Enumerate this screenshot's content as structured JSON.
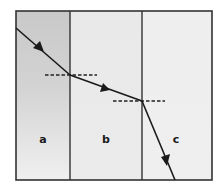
{
  "diagram": {
    "type": "refraction through three media",
    "regions": [
      {
        "label": "a",
        "fill_top": "#cfcfcf",
        "fill_bottom": "#ececec"
      },
      {
        "label": "b",
        "fill_top": "#e6e6e6",
        "fill_bottom": "#ececec"
      },
      {
        "label": "c",
        "fill_top": "#eeeeee",
        "fill_bottom": "#efefef"
      }
    ],
    "ray": {
      "description": "Ray travels through region a, refracts at boundary a|b bending away from normal, then refracts at boundary b|c bending toward the normal, exiting at bottom of region c",
      "color": "#1a1a1a"
    },
    "normals": {
      "style": "dashed",
      "count": 2
    },
    "border_color": "#333333"
  }
}
